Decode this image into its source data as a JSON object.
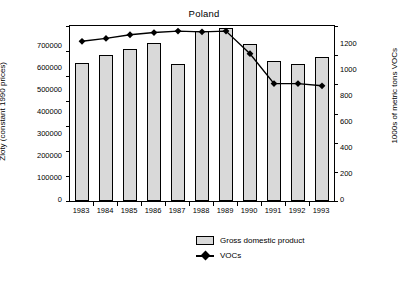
{
  "chart_data": {
    "type": "bar",
    "title": "Poland",
    "xlabel": "",
    "ylabel": "Zloty (constant 1990 prices)",
    "ylabel_right": "1000s of metric tons VOCs",
    "categories": [
      "1983",
      "1984",
      "1985",
      "1986",
      "1987",
      "1988",
      "1989",
      "1990",
      "1991",
      "1992",
      "1993"
    ],
    "ylim": [
      0,
      700000
    ],
    "yticks": [
      0,
      100000,
      200000,
      300000,
      400000,
      500000,
      600000,
      700000
    ],
    "ylim_right": [
      0,
      1200
    ],
    "yticks_right": [
      0,
      200,
      400,
      600,
      800,
      1000,
      1200
    ],
    "grid": false,
    "legend_position": "bottom",
    "series": [
      {
        "name": "Gross domestic product",
        "type": "bar",
        "axis": "left",
        "values": [
          553000,
          585000,
          610000,
          633000,
          547000,
          680000,
          693000,
          630000,
          560000,
          548000,
          575000
        ]
      },
      {
        "name": "VOCs",
        "type": "line",
        "axis": "right",
        "values": [
          1095,
          1115,
          1140,
          1155,
          1165,
          1160,
          1165,
          1010,
          805,
          805,
          790
        ]
      }
    ]
  },
  "legend": {
    "items": [
      {
        "label": "Gross domestic product",
        "marker": "bar-swatch"
      },
      {
        "label": "VOCs",
        "marker": "diamond-line"
      }
    ]
  }
}
